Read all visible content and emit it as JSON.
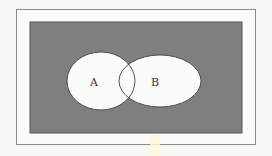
{
  "diagram": {
    "type": "venn",
    "universe": {
      "shaded": true,
      "fill": "#7f7f7f"
    },
    "sets": [
      {
        "label": "A",
        "fill": "#fbfbf9"
      },
      {
        "label": "B",
        "fill": "#fbfbf9"
      }
    ]
  },
  "colors": {
    "background": "#f6f6f4",
    "frame_border": "#8a8a8a",
    "universe_fill": "#7f7f7f",
    "set_fill": "#fbfbf9",
    "outline": "#444444"
  }
}
